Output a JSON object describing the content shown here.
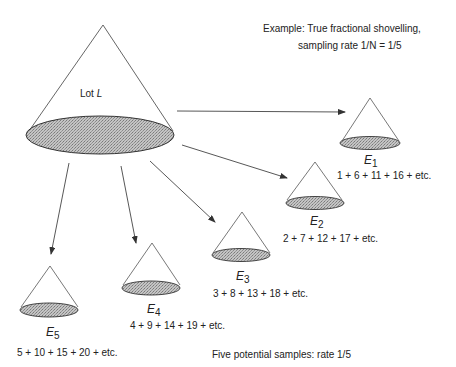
{
  "header": {
    "line1": "Example: True fractional shovelling,",
    "line2": "sampling rate 1/N = 1/5"
  },
  "lot": {
    "label_prefix": "Lot",
    "label_var": "L"
  },
  "samples": [
    {
      "name": "E",
      "index": "1",
      "sequence": "1 + 6 + 11 + 16 + etc."
    },
    {
      "name": "E",
      "index": "2",
      "sequence": "2 + 7 + 12 + 17 + etc."
    },
    {
      "name": "E",
      "index": "3",
      "sequence": "3 + 8 + 13 + 18 + etc."
    },
    {
      "name": "E",
      "index": "4",
      "sequence": "4 + 9 + 14 + 19 + etc."
    },
    {
      "name": "E",
      "index": "5",
      "sequence": "5 + 10 + 15 + 20 + etc."
    }
  ],
  "footer": {
    "caption": "Five potential samples: rate 1/5"
  },
  "colors": {
    "line": "#444444",
    "fill": "#b8b8b8"
  }
}
